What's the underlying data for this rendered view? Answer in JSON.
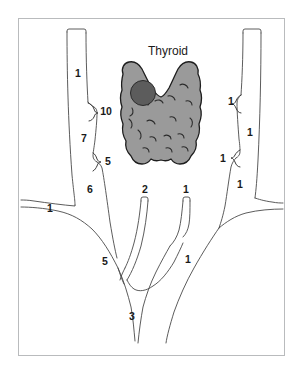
{
  "figure": {
    "name": "thyroid-and-neck-vessels-diagram",
    "title_label": "Thyroid",
    "frame_color": "#b9bbbd",
    "background_color": "#ffffff"
  },
  "gland": {
    "name": "thyroid-gland",
    "fill_color": "#9a9a9a",
    "outline_color": "#1d1d1d",
    "nodule": {
      "name": "thyroid-nodule",
      "fill_color": "#5c5c5c",
      "outline_color": "#2b2b2b"
    }
  },
  "labels": {
    "left": [
      {
        "id": "left-upper-vessel",
        "text": "1",
        "x": 78,
        "y": 74
      },
      {
        "id": "left-brace-10",
        "text": "10",
        "x": 106,
        "y": 112
      },
      {
        "id": "left-segment-7",
        "text": "7",
        "x": 84,
        "y": 139
      },
      {
        "id": "left-brace-5",
        "text": "5",
        "x": 106,
        "y": 162
      },
      {
        "id": "left-segment-6",
        "text": "6",
        "x": 90,
        "y": 190
      },
      {
        "id": "left-outer-branch-1",
        "text": "1",
        "x": 50,
        "y": 209
      }
    ],
    "right": [
      {
        "id": "right-brace-1-upper",
        "text": "1",
        "x": 231,
        "y": 102
      },
      {
        "id": "right-segment-1-mid",
        "text": "1",
        "x": 250,
        "y": 133
      },
      {
        "id": "right-brace-1-lower",
        "text": "1",
        "x": 223,
        "y": 159
      },
      {
        "id": "right-segment-1-low",
        "text": "1",
        "x": 240,
        "y": 185
      }
    ],
    "center": [
      {
        "id": "center-vessel-2",
        "text": "2",
        "x": 145,
        "y": 190
      },
      {
        "id": "center-vessel-1",
        "text": "1",
        "x": 186,
        "y": 190
      },
      {
        "id": "center-branch-5",
        "text": "5",
        "x": 105,
        "y": 262
      },
      {
        "id": "center-branch-1",
        "text": "1",
        "x": 188,
        "y": 260
      },
      {
        "id": "center-trunk-3",
        "text": "3",
        "x": 132,
        "y": 317
      }
    ]
  },
  "legend_values": {
    "distinct_numbers": [
      "1",
      "2",
      "3",
      "5",
      "6",
      "7",
      "10"
    ]
  }
}
